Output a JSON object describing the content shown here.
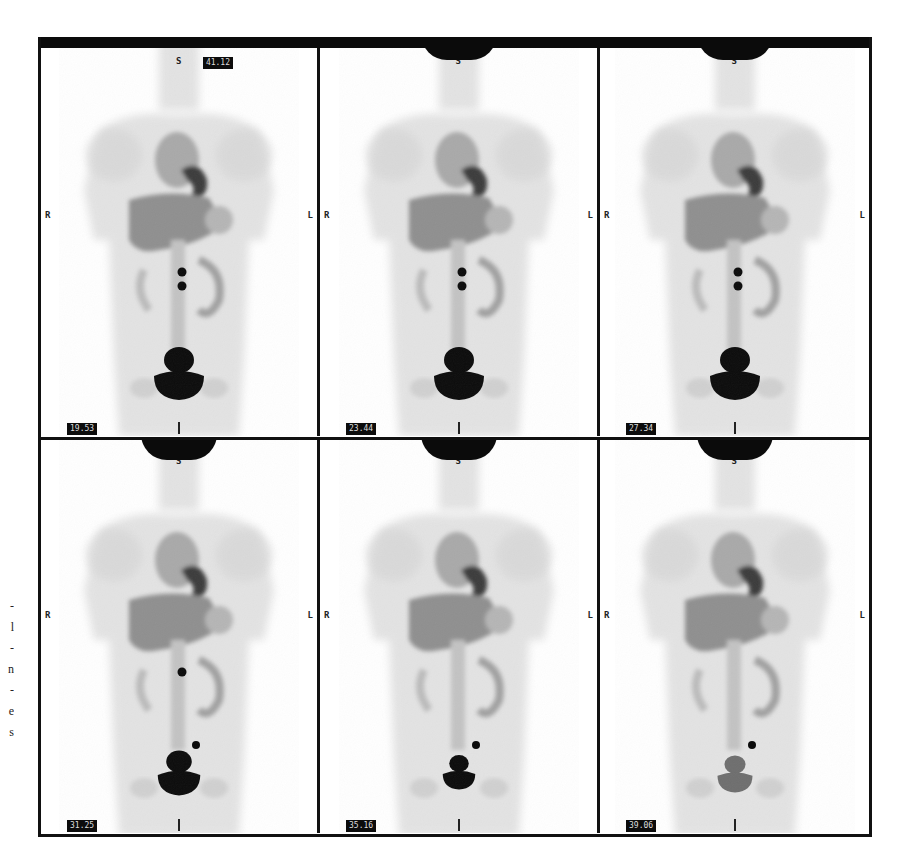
{
  "figure": {
    "margin_text_fragment": [
      "-",
      "l",
      "-",
      "n",
      "-",
      "e",
      "s"
    ],
    "panels": [
      {
        "row": 0,
        "col": 0,
        "time_label": "19.53",
        "top_label": "41.12",
        "orientation_top": "S",
        "orientation_left": "R",
        "orientation_right": "L",
        "orientation_bottom": "I",
        "bladder": "large",
        "gut_spots": 2,
        "neck_blob": false
      },
      {
        "row": 0,
        "col": 1,
        "time_label": "23.44",
        "top_label": null,
        "orientation_top": "S",
        "orientation_left": "R",
        "orientation_right": "L",
        "orientation_bottom": "I",
        "bladder": "large",
        "gut_spots": 2,
        "neck_blob": true
      },
      {
        "row": 0,
        "col": 2,
        "time_label": "27.34",
        "top_label": null,
        "orientation_top": "S",
        "orientation_left": "R",
        "orientation_right": "L",
        "orientation_bottom": "I",
        "bladder": "large",
        "gut_spots": 2,
        "neck_blob": true
      },
      {
        "row": 1,
        "col": 0,
        "time_label": "31.25",
        "top_label": null,
        "orientation_top": "S",
        "orientation_left": "R",
        "orientation_right": "L",
        "orientation_bottom": "I",
        "bladder": "medium",
        "gut_spots": 1,
        "neck_blob": true
      },
      {
        "row": 1,
        "col": 1,
        "time_label": "35.16",
        "top_label": null,
        "orientation_top": "S",
        "orientation_left": "R",
        "orientation_right": "L",
        "orientation_bottom": "I",
        "bladder": "small",
        "gut_spots": 0,
        "neck_blob": true
      },
      {
        "row": 1,
        "col": 2,
        "time_label": "39.06",
        "top_label": null,
        "orientation_top": "S",
        "orientation_left": "R",
        "orientation_right": "L",
        "orientation_bottom": "I",
        "bladder": "faint",
        "gut_spots": 0,
        "neck_blob": true
      }
    ]
  },
  "colors": {
    "frame": "#111111",
    "tracer_high": "#0b0b0b",
    "tracer_mid": "#8a8a8a",
    "tracer_low": "#d8d8d8",
    "background": "#ffffff"
  }
}
